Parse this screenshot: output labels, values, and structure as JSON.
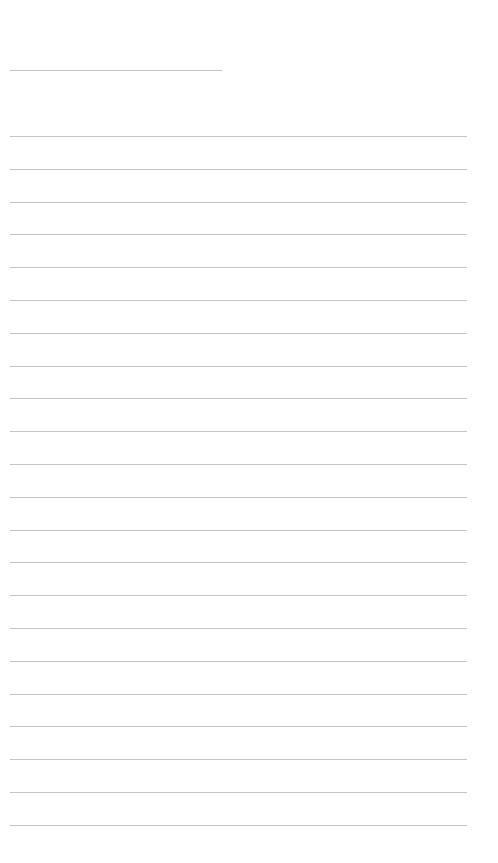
{
  "page": {
    "background": "#ffffff",
    "line_color": "#c4c4c4"
  },
  "header": {
    "title_line_text": ""
  },
  "ruled_lines": {
    "count": 22,
    "first_y": 136,
    "spacing": 32.8,
    "lines": [
      "",
      "",
      "",
      "",
      "",
      "",
      "",
      "",
      "",
      "",
      "",
      "",
      "",
      "",
      "",
      "",
      "",
      "",
      "",
      "",
      "",
      ""
    ]
  }
}
